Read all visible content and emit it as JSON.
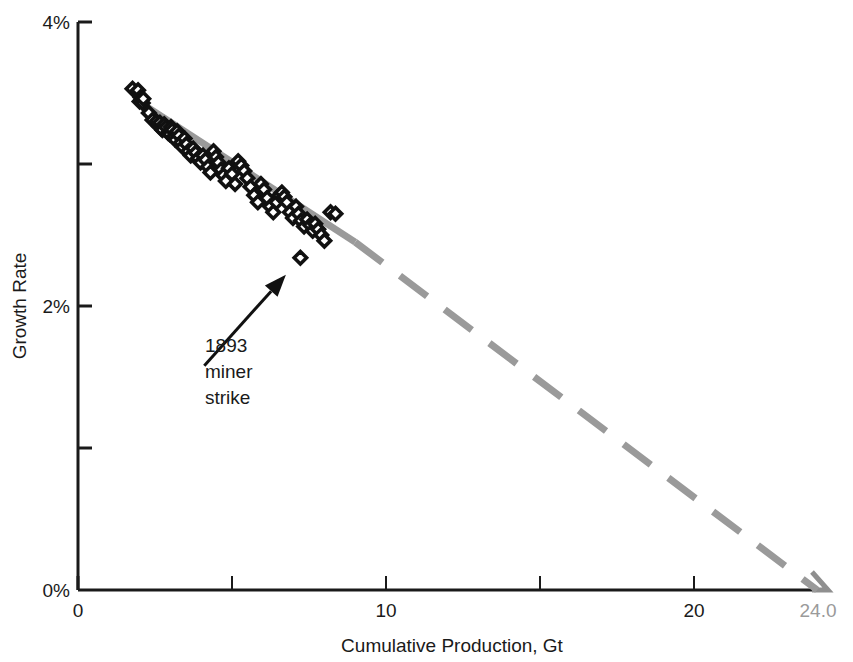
{
  "chart_data": {
    "type": "scatter",
    "title": "",
    "xlabel": "Cumulative Production, Gt",
    "ylabel": "Growth Rate",
    "xlim": [
      0,
      24.7
    ],
    "ylim": [
      0,
      4
    ],
    "grid": false,
    "legend": null,
    "x_ticks": [
      {
        "value": 0,
        "label": "0",
        "major": true
      },
      {
        "value": 5,
        "label": "",
        "major": false
      },
      {
        "value": 10,
        "label": "10",
        "major": true
      },
      {
        "value": 15,
        "label": "",
        "major": false
      },
      {
        "value": 20,
        "label": "20",
        "major": true
      }
    ],
    "x_end_label": "24.0",
    "y_ticks": [
      {
        "value": 0,
        "label": "0%"
      },
      {
        "value": 1,
        "label": ""
      },
      {
        "value": 2,
        "label": "2%"
      },
      {
        "value": 3,
        "label": ""
      },
      {
        "value": 4,
        "label": "4%"
      }
    ],
    "series": [
      {
        "name": "Growth Rate vs Cumulative Production",
        "marker": "open-diamond",
        "marker_color": "#111111",
        "points": [
          [
            1.77,
            3.53
          ],
          [
            1.95,
            3.52
          ],
          [
            2.0,
            3.44
          ],
          [
            2.03,
            3.47
          ],
          [
            2.06,
            3.45
          ],
          [
            2.1,
            3.43
          ],
          [
            2.12,
            3.46
          ],
          [
            2.3,
            3.36
          ],
          [
            2.42,
            3.31
          ],
          [
            2.55,
            3.3
          ],
          [
            2.62,
            3.27
          ],
          [
            2.66,
            3.29
          ],
          [
            2.7,
            3.25
          ],
          [
            2.74,
            3.24
          ],
          [
            2.8,
            3.28
          ],
          [
            2.86,
            3.26
          ],
          [
            2.92,
            3.22
          ],
          [
            2.98,
            3.21
          ],
          [
            3.02,
            3.26
          ],
          [
            3.06,
            3.24
          ],
          [
            3.1,
            3.19
          ],
          [
            3.16,
            3.17
          ],
          [
            3.22,
            3.23
          ],
          [
            3.28,
            3.2
          ],
          [
            3.34,
            3.15
          ],
          [
            3.4,
            3.12
          ],
          [
            3.46,
            3.18
          ],
          [
            3.52,
            3.14
          ],
          [
            3.58,
            3.09
          ],
          [
            3.66,
            3.06
          ],
          [
            3.74,
            3.11
          ],
          [
            3.82,
            3.08
          ],
          [
            3.9,
            3.04
          ],
          [
            3.98,
            3.01
          ],
          [
            4.06,
            3.06
          ],
          [
            4.14,
            3.03
          ],
          [
            4.22,
            2.98
          ],
          [
            4.3,
            2.94
          ],
          [
            4.4,
            3.09
          ],
          [
            4.48,
            3.05
          ],
          [
            4.56,
            3.01
          ],
          [
            4.64,
            2.96
          ],
          [
            4.72,
            2.92
          ],
          [
            4.8,
            2.88
          ],
          [
            4.9,
            2.97
          ],
          [
            5.0,
            2.93
          ],
          [
            5.1,
            2.86
          ],
          [
            5.2,
            3.02
          ],
          [
            5.3,
            2.99
          ],
          [
            5.4,
            2.95
          ],
          [
            5.5,
            2.9
          ],
          [
            5.6,
            2.84
          ],
          [
            5.72,
            2.78
          ],
          [
            5.84,
            2.73
          ],
          [
            5.94,
            2.86
          ],
          [
            6.04,
            2.82
          ],
          [
            6.14,
            2.76
          ],
          [
            6.24,
            2.7
          ],
          [
            6.34,
            2.66
          ],
          [
            6.44,
            2.73
          ],
          [
            6.54,
            2.78
          ],
          [
            6.62,
            2.8
          ],
          [
            6.7,
            2.77
          ],
          [
            6.78,
            2.73
          ],
          [
            6.88,
            2.66
          ],
          [
            6.98,
            2.62
          ],
          [
            7.08,
            2.7
          ],
          [
            7.16,
            2.65
          ],
          [
            7.24,
            2.6
          ],
          [
            7.34,
            2.56
          ],
          [
            7.44,
            2.61
          ],
          [
            7.54,
            2.57
          ],
          [
            7.62,
            2.53
          ],
          [
            7.7,
            2.58
          ],
          [
            7.8,
            2.54
          ],
          [
            7.9,
            2.5
          ],
          [
            8.0,
            2.46
          ],
          [
            8.2,
            2.66
          ],
          [
            8.36,
            2.65
          ]
        ]
      },
      {
        "name": "1893 miner strike outlier",
        "marker": "open-diamond",
        "marker_color": "#111111",
        "points": [
          [
            7.22,
            2.34
          ]
        ]
      }
    ],
    "trend_line": {
      "name": "linear extrapolation to depletion",
      "color": "#9a9a9a",
      "solid_segment": [
        [
          1.9,
          3.45
        ],
        [
          9.0,
          2.45
        ]
      ],
      "dashed_segment": [
        [
          9.0,
          2.45
        ],
        [
          24.0,
          0.0
        ]
      ],
      "x_intercept": 24.0
    },
    "annotations": [
      {
        "name": "miner-strike-annotation",
        "lines": [
          "1893",
          "miner",
          "strike"
        ],
        "arrow_from": [
          4.1,
          1.58
        ],
        "arrow_to": [
          6.75,
          2.22
        ]
      }
    ]
  }
}
